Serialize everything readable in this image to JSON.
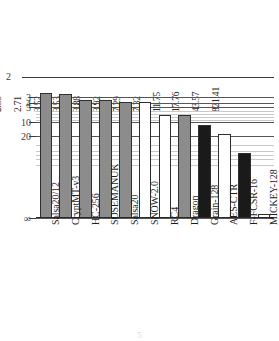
{
  "chart_data": {
    "type": "bar",
    "title": "",
    "subtitle": "",
    "xlabel": "",
    "ylabel": "",
    "orientation": "vertical",
    "scale": "log-inverted",
    "axis_note": "y-axis is inverted (smaller values higher) with a broken segment above 2",
    "categories": [
      "Salsa20/12",
      "CryptMT-v3",
      "HC-256",
      "SOSEMANUK",
      "Salsa20",
      "SNOW-2.0",
      "RC4",
      "Dragon",
      "Grain-128",
      "AES-CTR",
      "F-FCSR-16",
      "MICKEY-128"
    ],
    "values": [
      2.55,
      2.71,
      3.52,
      3.53,
      3.88,
      3.92,
      7.29,
      7.32,
      11.75,
      17.76,
      43.57,
      821.41
    ],
    "value_labels": [
      "2.55",
      "2.71",
      "3.52",
      "3.53",
      "3.88",
      "3.92",
      "7.29",
      "7.32",
      "11.75",
      "17.76",
      "43.57",
      "821.41"
    ],
    "bar_styles": [
      "gray",
      "gray",
      "gray",
      "gray",
      "gray",
      "white",
      "white",
      "gray",
      "black",
      "white",
      "black",
      "white"
    ],
    "colors": {
      "gray": "#8c8c8c",
      "white": "#ffffff",
      "black": "#1a1a1a",
      "outline": "#2f2f2f",
      "gridline": "#555555",
      "gridline_minor": "#c9c9c9",
      "axis": "#2a2a2a",
      "text": "#1d1d1d"
    },
    "y_ticks_major": [
      "2",
      "3",
      "4",
      "5",
      "10",
      "20",
      "∞"
    ],
    "y_ticks_major_values": [
      2,
      3,
      4,
      5,
      10,
      20,
      0
    ],
    "y_ticks_minor_values": [
      6,
      7,
      8,
      9,
      30,
      40,
      50,
      60,
      80
    ],
    "ylim": [
      2,
      1000
    ],
    "grid": true,
    "legend": null,
    "legend_position": "none",
    "broken_axis": {
      "present": true,
      "tick_label": "2"
    }
  },
  "axis": {
    "top_break_label": "2",
    "infinity_label": "∞"
  },
  "caption": {
    "ghost_text": "5"
  }
}
